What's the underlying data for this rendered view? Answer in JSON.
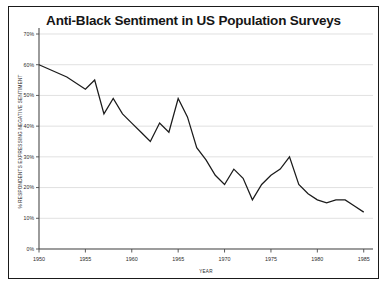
{
  "chart_data": {
    "type": "line",
    "title": "Anti-Black Sentiment in US Population Surveys",
    "xlabel": "YEAR",
    "ylabel": "% RESPONDENTS EXPRESSING NEGATIVE SENTIMENT",
    "xlim": [
      1950,
      1986
    ],
    "ylim": [
      0,
      70
    ],
    "grid": true,
    "legend": "none",
    "y_ticks": [
      0,
      10,
      20,
      30,
      40,
      50,
      60,
      70
    ],
    "y_tick_labels": [
      "0%",
      "10%",
      "20%",
      "30%",
      "40%",
      "50%",
      "60%",
      "70%"
    ],
    "x_ticks": [
      1950,
      1955,
      1960,
      1965,
      1970,
      1975,
      1980,
      1985
    ],
    "x_tick_labels": [
      "1950",
      "1955",
      "1960",
      "1965",
      "1970",
      "1975",
      "1980",
      "1985"
    ],
    "series": [
      {
        "name": "Anti-Black sentiment",
        "color": "#1b1b1b",
        "x": [
          1950,
          1953,
          1955,
          1956,
          1957,
          1958,
          1959,
          1960,
          1961,
          1962,
          1963,
          1964,
          1965,
          1966,
          1967,
          1968,
          1969,
          1970,
          1971,
          1972,
          1973,
          1974,
          1975,
          1976,
          1977,
          1978,
          1979,
          1980,
          1981,
          1982,
          1983,
          1984,
          1985
        ],
        "values": [
          60,
          56,
          52,
          55,
          44,
          49,
          44,
          41,
          38,
          35,
          41,
          38,
          49,
          43,
          33,
          29,
          24,
          21,
          26,
          23,
          16,
          21,
          24,
          26,
          30,
          21,
          18,
          16,
          15,
          16,
          16,
          14,
          12
        ]
      }
    ]
  }
}
